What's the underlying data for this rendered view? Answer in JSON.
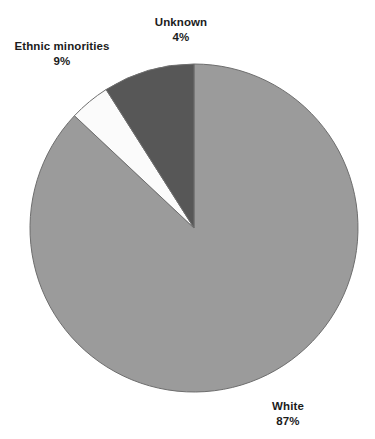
{
  "title_fragment": "................",
  "chart_data": {
    "type": "pie",
    "title": "",
    "xlabel": "",
    "ylabel": "",
    "legend_position": "none",
    "grid": false,
    "start_angle_deg": 0,
    "direction": "clockwise",
    "center": {
      "x": 194,
      "y": 228
    },
    "radius": 164,
    "categories": [
      "White",
      "Unknown",
      "Ethnic minorities"
    ],
    "values": [
      87,
      4,
      9
    ],
    "unit": "%",
    "slices": [
      {
        "label": "White",
        "value": 87,
        "value_text": "87%",
        "color": "#9b9b9b",
        "start_deg": 0,
        "end_deg": 313.2
      },
      {
        "label": "Unknown",
        "value": 4,
        "value_text": "4%",
        "color": "#fbfbfb",
        "start_deg": 313.2,
        "end_deg": 327.6
      },
      {
        "label": "Ethnic minorities",
        "value": 9,
        "value_text": "9%",
        "color": "#575757",
        "start_deg": 327.6,
        "end_deg": 360
      }
    ]
  },
  "annotations": {
    "unknown": {
      "label": "Unknown",
      "value_text": "4%"
    },
    "ethnic": {
      "label": "Ethnic minorities",
      "value_text": "9%"
    },
    "white": {
      "label": "White",
      "value_text": "87%"
    }
  },
  "colors": {
    "white_slice": "#9b9b9b",
    "unknown_slice": "#fbfbfb",
    "ethnic_slice": "#575757",
    "outline": "#6e6e6e",
    "text": "#1c1c1c",
    "background": "#ffffff"
  }
}
